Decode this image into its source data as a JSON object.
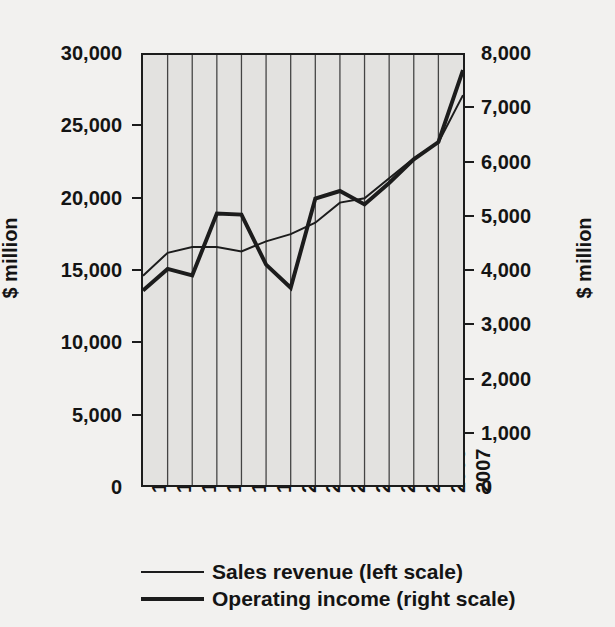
{
  "chart_data": {
    "type": "line",
    "title": "",
    "xlabel": "",
    "ylabel": "$ million",
    "ylabel_right": "$ million",
    "grid": true,
    "grid_orientation": "vertical",
    "legend_position": "bottom",
    "plot_background": "#e3e2e0",
    "page_background": "#f2f1ef",
    "line_color": "#1c1c1c",
    "categories": [
      "1994",
      "1995",
      "1996",
      "1997",
      "1998",
      "1999",
      "2000",
      "2001",
      "2002",
      "2003",
      "2004",
      "2005",
      "2006",
      "2007"
    ],
    "yaxis_left": {
      "label": "$ million",
      "ticks": [
        "0",
        "5,000",
        "10,000",
        "15,000",
        "20,000",
        "25,000",
        "30,000"
      ],
      "tick_values": [
        0,
        5000,
        10000,
        15000,
        20000,
        25000,
        30000
      ],
      "ylim": [
        0,
        30000
      ]
    },
    "yaxis_right": {
      "label": "$ million",
      "ticks": [
        "0",
        "1,000",
        "2,000",
        "3,000",
        "4,000",
        "5,000",
        "6,000",
        "7,000",
        "8,000"
      ],
      "tick_values": [
        0,
        1000,
        2000,
        3000,
        4000,
        5000,
        6000,
        7000,
        8000
      ],
      "ylim": [
        0,
        8000
      ]
    },
    "series": [
      {
        "name": "Sales revenue (left scale)",
        "axis": "left",
        "stroke_width": 2,
        "values": [
          14600,
          16200,
          16600,
          16600,
          16300,
          17000,
          17500,
          18300,
          19700,
          20000,
          21400,
          22800,
          23900,
          27200
        ]
      },
      {
        "name": "Operating income (right scale)",
        "axis": "right",
        "stroke_width": 4,
        "values": [
          3620,
          4020,
          3900,
          5050,
          5030,
          4100,
          3670,
          5330,
          5470,
          5220,
          5620,
          6060,
          6380,
          7720
        ]
      }
    ],
    "legend": [
      {
        "label": "Sales revenue (left scale)",
        "line": "thin"
      },
      {
        "label": "Operating income (right scale)",
        "line": "thick"
      }
    ]
  }
}
